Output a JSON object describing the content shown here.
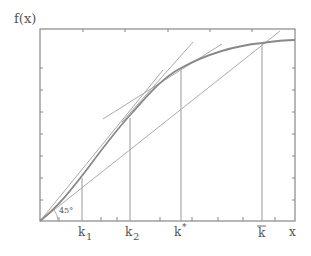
{
  "diagram": {
    "y_axis_label": "f(x)",
    "x_axis_label": "x",
    "angle_label": "45°",
    "x_markers": [
      {
        "label": "k",
        "sub": "1",
        "sup": "",
        "bar": false
      },
      {
        "label": "k",
        "sub": "2",
        "sup": "",
        "bar": false
      },
      {
        "label": "k",
        "sub": "",
        "sup": "*",
        "bar": false
      },
      {
        "label": "k",
        "sub": "",
        "sup": "",
        "bar": true
      }
    ],
    "elements": [
      "concave production curve f(x)",
      "45-degree line from origin",
      "chord from origin",
      "tangent line at k2",
      "tangent line at k*",
      "vertical lines at k1, k2, k*, k-bar"
    ],
    "colors": {
      "frame": "#777777",
      "curve": "#888888",
      "lines": "#999999",
      "text": "#555555"
    }
  }
}
